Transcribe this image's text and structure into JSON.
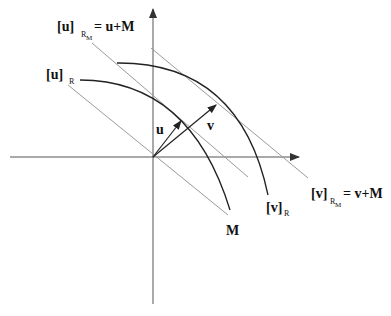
{
  "diagram": {
    "colors": {
      "axis": "#555555",
      "line": "#9a9a9a",
      "arc": "#222222",
      "vector": "#222222"
    },
    "labels": {
      "u_rm_main": "[u]",
      "u_rm_sub": "R",
      "u_rm_subsub": "M",
      "u_rm_eq": "= u+M",
      "u_r_main": "[u]",
      "u_r_sub": "R",
      "v_rm_main": "[v]",
      "v_rm_sub": "R",
      "v_rm_subsub": "M",
      "v_rm_eq": "= v+M",
      "v_r_main": "[v]",
      "v_r_sub": "R",
      "vec_u": "u",
      "vec_v": "v",
      "line_M": "M"
    }
  }
}
